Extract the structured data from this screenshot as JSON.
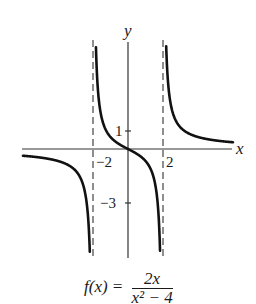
{
  "chart_data": {
    "type": "line",
    "title": "",
    "function": "f(x) = 2x / (x^2 - 4)",
    "xlabel": "x",
    "ylabel": "y",
    "xlim": [
      -6,
      6
    ],
    "ylim": [
      -6,
      6
    ],
    "grid": false,
    "tick_labels": {
      "x": [
        "-2",
        "2"
      ],
      "y": [
        "1",
        "-3"
      ]
    },
    "asymptotes": {
      "vertical": [
        -2,
        2
      ],
      "horizontal": [
        0
      ],
      "style": "dashed"
    },
    "series": [
      {
        "name": "branch-left",
        "x": [
          -6,
          -5,
          -4,
          -3,
          -2.5,
          -2.2
        ],
        "y": [
          -0.375,
          -0.476,
          -0.667,
          -1.2,
          -2.222,
          -5.238
        ]
      },
      {
        "name": "branch-middle",
        "x": [
          -1.8,
          -1.5,
          -1,
          0,
          1,
          1.5,
          1.8
        ],
        "y": [
          4.737,
          1.714,
          0.667,
          0,
          -0.667,
          -1.714,
          -4.737
        ]
      },
      {
        "name": "branch-right",
        "x": [
          2.2,
          2.5,
          3,
          4,
          5,
          6
        ],
        "y": [
          5.238,
          2.222,
          1.2,
          0.667,
          0.476,
          0.375
        ]
      }
    ]
  },
  "labels": {
    "x_axis": "x",
    "y_axis": "y",
    "tick_neg2": "−2",
    "tick_pos2": "2",
    "tick_1": "1",
    "tick_neg3": "−3"
  },
  "formula": {
    "lhs": "f(x) =",
    "numerator": "2x",
    "denominator": "x² − 4"
  }
}
